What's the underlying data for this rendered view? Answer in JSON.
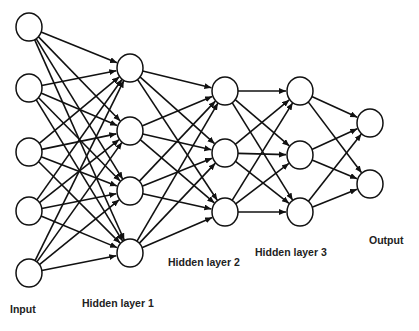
{
  "diagram": {
    "stroke_color": "#111111",
    "node_fill": "#ffffff",
    "node_radius": 13,
    "layers": [
      {
        "name": "Input",
        "label": "Input",
        "x": 29,
        "ys": [
          27,
          88,
          152,
          211,
          273
        ],
        "label_pos": [
          10,
          303
        ]
      },
      {
        "name": "Hidden layer 1",
        "label": "Hidden layer 1",
        "x": 130,
        "ys": [
          68,
          131,
          191,
          253
        ],
        "label_pos": [
          82,
          297
        ]
      },
      {
        "name": "Hidden layer 2",
        "label": "Hidden layer 2",
        "x": 225,
        "ys": [
          91,
          153,
          212
        ],
        "label_pos": [
          168,
          256
        ]
      },
      {
        "name": "Hidden layer 3",
        "label": "Hidden layer 3",
        "x": 300,
        "ys": [
          91,
          155,
          212
        ],
        "label_pos": [
          255,
          246
        ]
      },
      {
        "name": "Output",
        "label": "Output",
        "x": 370,
        "ys": [
          123,
          184
        ],
        "label_pos": [
          369,
          234
        ]
      }
    ],
    "connectivity": "fully-connected between consecutive layers, arrows pointing right"
  }
}
